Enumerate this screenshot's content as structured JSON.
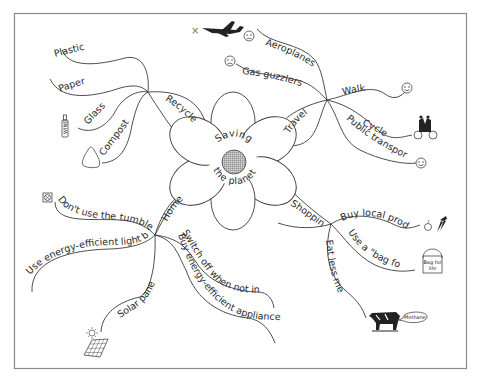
{
  "title": "Saving the planet",
  "center": {
    "line1": "Saving",
    "line2": "the planet"
  },
  "branches": {
    "recycle": {
      "label": "Recycle",
      "children": [
        {
          "label": "Plastic"
        },
        {
          "label": "Paper"
        },
        {
          "label": "Glass",
          "icon": "wine-bottle-icon",
          "icon_text": "WINE"
        },
        {
          "label": "Compost",
          "icon": "compost-heap-icon"
        }
      ]
    },
    "travel": {
      "label": "Travel",
      "children": [
        {
          "label": "Aeroplanes",
          "icon": "sad-face-icon"
        },
        {
          "label": "Gas guzzlers",
          "icon": "sad-face-icon"
        },
        {
          "label": "Walk",
          "icon": "happy-face-icon"
        },
        {
          "label": "Cycle",
          "icon": "tandem-bicycle-icon"
        },
        {
          "label": "Public transport",
          "icon": "happy-face-icon"
        }
      ],
      "decor": {
        "icon": "crossed-out-aeroplane-icon",
        "mark": "×"
      }
    },
    "home": {
      "label": "Home",
      "children": [
        {
          "label": "Don't use the tumble dryer",
          "icon": "tumble-dryer-icon"
        },
        {
          "label": "Use energy-efficient light bulbs"
        },
        {
          "label": "Solar panels",
          "icon": "solar-panel-icon"
        },
        {
          "label": "Buy energy-efficient appliances"
        },
        {
          "label": "Switch off when not in use"
        }
      ]
    },
    "shopping": {
      "label": "Shopping",
      "children": [
        {
          "label": "Buy local produce",
          "icon": "apple-carrots-icon"
        },
        {
          "label": "Use a \"bag for life\"",
          "icon": "bag-icon",
          "icon_text_1": "Bag for",
          "icon_text_2": "life"
        },
        {
          "label": "Eat less meat",
          "icon": "cow-icon",
          "bubble_text": "Methane"
        }
      ]
    }
  },
  "colors": {
    "line": "#3a3a3a",
    "frame": "#8a8a8a",
    "text": "#2a2a2a",
    "background": "#ffffff"
  }
}
